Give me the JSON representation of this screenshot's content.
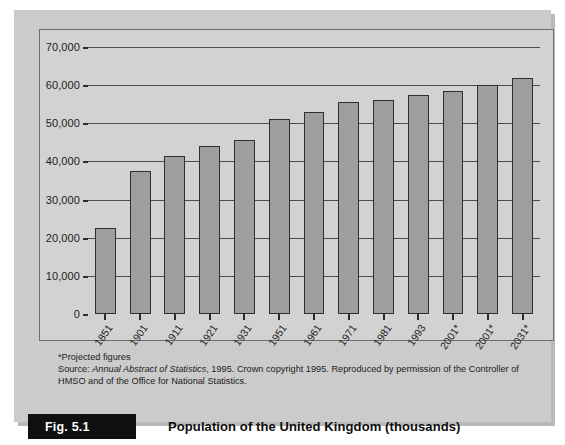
{
  "figure": {
    "badge_label": "Fig. 5.1",
    "title": "Population of the United Kingdom (thousands)",
    "footnote": "*Projected figures",
    "source_prefix": "Source: ",
    "source_italic": "Annual Abstract of Statistics",
    "source_rest": ", 1995. Crown copyright 1995. Reproduced by permission of the Controller of HMSO and of the Office for National Statistics."
  },
  "colors": {
    "page_background": "#ffffff",
    "panel_background": "#cbcbcb",
    "plot_background": "#d2d2d2",
    "bar_fill": "#9e9e9e",
    "bar_border": "#2f2f2f",
    "axis": "#2b2b2b",
    "gridline": "#4c4c4c",
    "badge_background": "#101010",
    "badge_text": "#ffffff",
    "text": "#1b1b1b"
  },
  "chart_data": {
    "type": "bar",
    "title": "Population of the United Kingdom (thousands)",
    "xlabel": "",
    "ylabel": "",
    "grid": true,
    "legend": "none",
    "ylim": [
      0,
      70000
    ],
    "ytick_values": [
      0,
      10000,
      20000,
      30000,
      40000,
      50000,
      60000,
      70000
    ],
    "ytick_labels": [
      "0",
      "10,000",
      "20,000",
      "30,000",
      "40,000",
      "50,000",
      "60,000",
      "70,000"
    ],
    "categories": [
      "1851",
      "1901",
      "1911",
      "1921",
      "1931",
      "1951",
      "1961",
      "1971",
      "1981",
      "1993",
      "2001*",
      "2001*",
      "2031*"
    ],
    "values": [
      22500,
      37500,
      41500,
      44000,
      45500,
      51000,
      53000,
      55500,
      56000,
      57500,
      58500,
      60000,
      62000
    ]
  }
}
